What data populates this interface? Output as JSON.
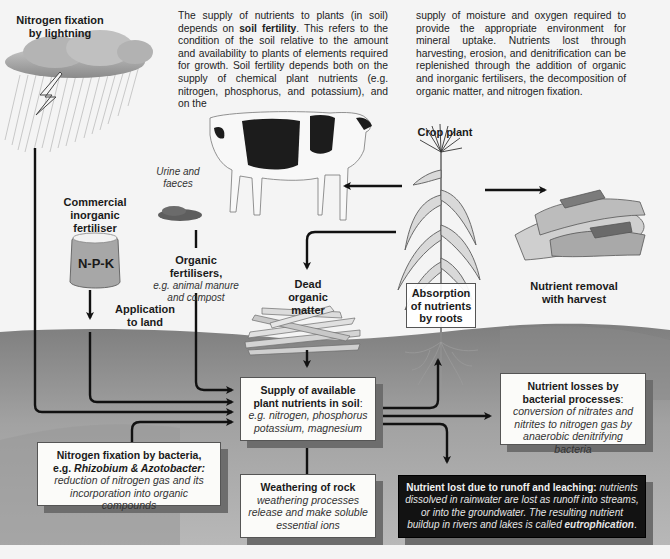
{
  "intro_text": {
    "col1": {
      "p1": "The supply of nutrients to plants (in soil) depends on ",
      "bold": "soil fertility",
      "p2": ". This refers to the condition of the soil relative to the amount and availability to plants of elements required for growth. Soil fertility depends both on the supply of chemical plant nutrients (e.g. nitrogen, phosphorus, and potassium), and on the"
    },
    "col2": "supply of moisture and oxygen required to provide the appropriate environment for mineral uptake. Nutrients lost through harvesting, erosion, and denitrification can be replenished through the addition of organic and inorganic fertilisers, the decomposition of organic matter, and nitrogen fixation."
  },
  "labels": {
    "lightning": "Nitrogen fixation by lightning",
    "urine": "Urine and faeces",
    "commercial_fertiliser": "Commercial inorganic fertiliser",
    "npk": "N-P-K",
    "organic_fertilisers_title": "Organic fertilisers,",
    "organic_fertilisers_detail": "e.g. animal manure and compost",
    "application": "Application to land",
    "dead_matter": "Dead organic matter",
    "crop_plant": "Crop plant",
    "absorption": "Absorption of nutrients by roots",
    "harvest": "Nutrient removal with harvest"
  },
  "boxes": {
    "supply": {
      "title": "Supply of available plant nutrients in soil",
      "colon": ": ",
      "detail": "e.g. nitrogen, phosphorus potassium, magnesium"
    },
    "bacterial_losses": {
      "title": "Nutrient losses by bacterial processes",
      "colon": ": ",
      "detail": "conversion of nitrates and nitrites to nitrogen gas by anaerobic denitrifying bacteria"
    },
    "nitrogen_fixation_bacteria": {
      "title": "Nitrogen fixation by bacteria,",
      "title2_prefix": "e.g. ",
      "title2_italic": "Rhizobium & Azotobacter:",
      "detail": "reduction of nitrogen gas and its incorporation into organic compounds"
    },
    "weathering": {
      "title": "Weathering of rock",
      "detail": "weathering processes release and make soluble essential ions"
    },
    "runoff": {
      "title": "Nutrient lost due to runoff and leaching:",
      "detail": " nutrients dissolved in rainwater are lost as runoff into streams, or into the groundwater. The resulting nutrient buildup in rivers and lakes is called ",
      "bold_end": "eutrophication",
      "end": "."
    }
  },
  "colors": {
    "background": "#f4f4f4",
    "soil_upper": "#8c8c8c",
    "soil_lower": "#a9a9a9",
    "arrow": "#111111",
    "dark_box": "#121212"
  }
}
